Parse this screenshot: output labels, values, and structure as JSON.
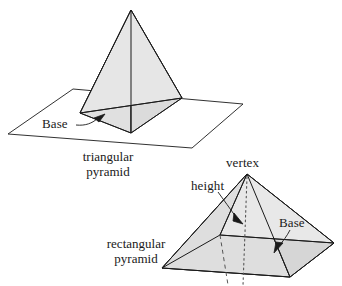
{
  "figure": {
    "background_color": "#ffffff",
    "stroke_color": "#1a1a1a",
    "face_fill_light": "#e3e3e3",
    "face_fill_dark": "#d2d2d2"
  },
  "triangular_pyramid": {
    "caption_line1": "triangular",
    "caption_line2": "pyramid",
    "base_label": "Base",
    "shape": "tetrahedron-on-plane",
    "apex": [
      131,
      10
    ],
    "base_vertices": [
      [
        80,
        113
      ],
      [
        182,
        98
      ],
      [
        131,
        133
      ]
    ],
    "plane_corners": [
      [
        8,
        134
      ],
      [
        73,
        89
      ],
      [
        243,
        104
      ],
      [
        192,
        148
      ]
    ]
  },
  "rectangular_pyramid": {
    "caption_line1": "rectangular",
    "caption_line2": "pyramid",
    "vertex_label": "vertex",
    "height_label": "height",
    "base_label": "Base",
    "apex": [
      247,
      174
    ],
    "base_corners": [
      [
        162,
        268
      ],
      [
        220,
        235
      ],
      [
        334,
        243
      ],
      [
        290,
        277
      ]
    ],
    "height_foot": [
      240,
      258
    ]
  }
}
